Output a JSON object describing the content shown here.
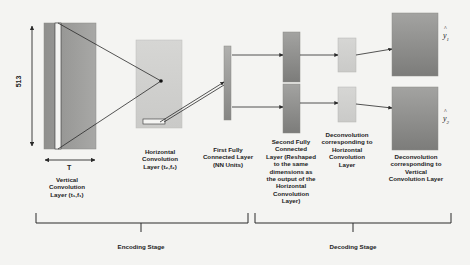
{
  "diagram": {
    "dimensions": {
      "height_label": "513",
      "width_label": "T"
    },
    "layers": {
      "vertical_conv": {
        "label": "Vertical Convolution Layer (t₁,f₁)"
      },
      "horizontal_conv": {
        "label": "Horizontal Convolution Layer (t₂,f₂)"
      },
      "first_fc": {
        "label": "First Fully Connected Layer (NN Units)"
      },
      "second_fc": {
        "label": "Second Fully Connected Layer (Reshaped to the same dimensions as the output of the Horizontal Convolution Layer)"
      },
      "deconv_horizontal": {
        "label": "Deconvolution corresponding to Horizontal Convolution Layer"
      },
      "deconv_vertical": {
        "label": "Deconvolution corresponding to Vertical Convolution Layer"
      }
    },
    "outputs": [
      {
        "symbol": "y",
        "subscript": "1"
      },
      {
        "symbol": "y",
        "subscript": "2"
      }
    ],
    "stages": {
      "encoding": "Encoding Stage",
      "decoding": "Decoding Stage"
    },
    "colors": {
      "background": "#f4f4f2",
      "dark_box_top": "#9a9a98",
      "dark_box_bottom": "#7a7a78",
      "light_box": "#d2d2d0",
      "line": "#2a2a2a"
    }
  }
}
